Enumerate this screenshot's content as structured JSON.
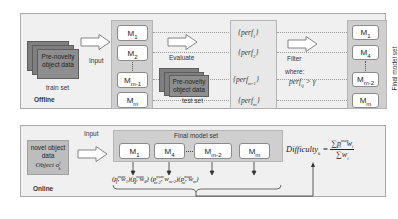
{
  "offline": {
    "section_label": "Offline",
    "train_stack": {
      "text_line1": "Pre-novelty",
      "text_line2": "object data",
      "caption": "train set"
    },
    "input_label": "Input",
    "models": [
      "M1",
      "M2",
      "Mm-1",
      "Mm"
    ],
    "models_display": [
      {
        "base": "M",
        "sub": "1"
      },
      {
        "base": "M",
        "sub": "2"
      },
      {
        "base": "M",
        "sub": "m-1"
      },
      {
        "base": "M",
        "sub": "m"
      }
    ],
    "evaluate_label": "Evaluate",
    "test_stack": {
      "text_line1": "Pre-novelty",
      "text_line2": "object data",
      "caption": "test set"
    },
    "perf_items": [
      "{perf1}",
      "{perf2}",
      "{perfm-1}",
      "{perfm}"
    ],
    "perf_display": [
      {
        "pre": "{perf",
        "sub": "1",
        "post": "}"
      },
      {
        "pre": "{perf",
        "sub": "2",
        "post": "}"
      },
      {
        "pre": "{perf",
        "sub": "m-1",
        "post": "}"
      },
      {
        "pre": "{perf",
        "sub": "m",
        "post": "}"
      }
    ],
    "filter_label": "Filter",
    "where_label": "where:",
    "condition": {
      "pre": "perf",
      "sub": "ij",
      "post": " > γ"
    },
    "final_set_label": "Final model set",
    "final_models_display": [
      {
        "base": "M",
        "sub": "1"
      },
      {
        "base": "M",
        "sub": "4"
      },
      {
        "base": "M",
        "sub": "m-2"
      },
      {
        "base": "M",
        "sub": "m"
      }
    ]
  },
  "online": {
    "section_label": "Online",
    "novel_box": {
      "line1": "novel object",
      "line2": "data",
      "object_pre": "Object ",
      "object_sym": "o",
      "object_sub": "k",
      "object_sup": "i"
    },
    "input_label": "Input",
    "final_set_label": "Final model set",
    "models_display": [
      {
        "base": "M",
        "sub": "1"
      },
      {
        "base": "M",
        "sub": "4"
      },
      {
        "base": "M",
        "sub": "m-2"
      },
      {
        "base": "M",
        "sub": "m"
      }
    ],
    "pairs": [
      {
        "p_sub": "1",
        "w_sub": "1"
      },
      {
        "p_sub": "4",
        "w_sub": "4"
      },
      {
        "p_sub": "m-2",
        "w_sub": "m-2"
      },
      {
        "p_sub": "m",
        "w_sub": "m"
      }
    ],
    "p_sup": "max",
    "formula": {
      "lhs": "Difficulty",
      "lhs_sub": "k",
      "num_sum": "∑",
      "num_p": "p",
      "num_p_sup": "max",
      "num_p_sub": "i",
      "num_w": "w",
      "num_w_sub": "i",
      "den_sum": "∑",
      "den_w": "w",
      "den_w_sub": "i"
    }
  }
}
